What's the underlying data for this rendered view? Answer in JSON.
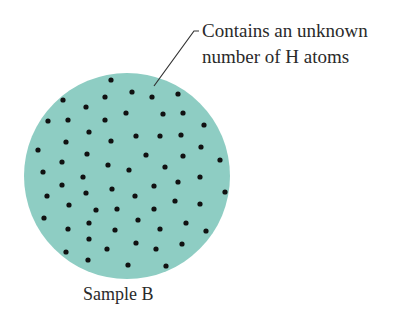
{
  "callout": {
    "line1": "Contains an unknown",
    "line2": "number of H atoms"
  },
  "caption": "Sample B",
  "colors": {
    "sample_fill": "#8ecdc3",
    "atom": "#111111",
    "leader_line": "#333333"
  },
  "sample": {
    "cx": 127,
    "cy": 176,
    "r": 103,
    "atoms": [
      [
        111,
        80
      ],
      [
        132,
        92
      ],
      [
        152,
        97
      ],
      [
        178,
        94
      ],
      [
        63,
        100
      ],
      [
        105,
        97
      ],
      [
        86,
        107
      ],
      [
        126,
        113
      ],
      [
        163,
        114
      ],
      [
        183,
        113
      ],
      [
        48,
        121
      ],
      [
        68,
        120
      ],
      [
        105,
        120
      ],
      [
        204,
        125
      ],
      [
        89,
        132
      ],
      [
        136,
        136
      ],
      [
        160,
        136
      ],
      [
        181,
        135
      ],
      [
        66,
        142
      ],
      [
        111,
        141
      ],
      [
        201,
        147
      ],
      [
        38,
        150
      ],
      [
        87,
        154
      ],
      [
        146,
        155
      ],
      [
        183,
        156
      ],
      [
        220,
        160
      ],
      [
        62,
        162
      ],
      [
        108,
        165
      ],
      [
        165,
        167
      ],
      [
        129,
        170
      ],
      [
        43,
        172
      ],
      [
        83,
        177
      ],
      [
        200,
        177
      ],
      [
        62,
        185
      ],
      [
        178,
        182
      ],
      [
        154,
        186
      ],
      [
        112,
        189
      ],
      [
        225,
        192
      ],
      [
        86,
        193
      ],
      [
        47,
        196
      ],
      [
        135,
        196
      ],
      [
        175,
        201
      ],
      [
        69,
        205
      ],
      [
        200,
        204
      ],
      [
        117,
        209
      ],
      [
        96,
        210
      ],
      [
        154,
        209
      ],
      [
        44,
        218
      ],
      [
        138,
        220
      ],
      [
        89,
        223
      ],
      [
        186,
        223
      ],
      [
        68,
        229
      ],
      [
        115,
        230
      ],
      [
        160,
        229
      ],
      [
        206,
        231
      ],
      [
        89,
        239
      ],
      [
        136,
        243
      ],
      [
        182,
        244
      ],
      [
        107,
        249
      ],
      [
        156,
        249
      ],
      [
        66,
        252
      ],
      [
        88,
        260
      ],
      [
        128,
        265
      ],
      [
        166,
        266
      ]
    ]
  }
}
